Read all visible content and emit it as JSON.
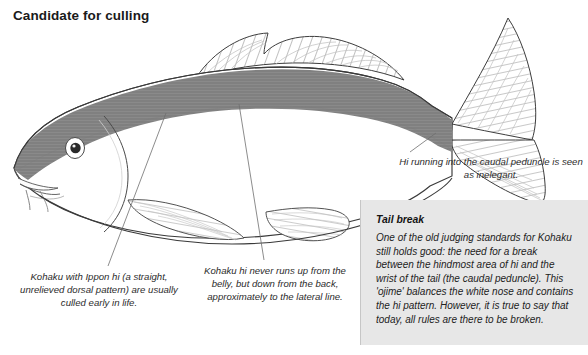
{
  "page": {
    "title": "Candidate for culling",
    "background_color": "#ffffff"
  },
  "illustration": {
    "name": "koi-kohaku-side-view",
    "hi_band_color": "#808080",
    "body_color": "#ffffff",
    "outline_color": "#3a3a3a",
    "fin_hatch_color": "#b4b4b4",
    "eye_color": "#1a1a1a",
    "leader_line_color": "#6e6e6e"
  },
  "captions": {
    "ippon": "Kohaku with Ippon hi (a straight, unrelieved dorsal pattern) are usually culled early in life.",
    "lateral_line": "Kohaku hi never runs up from the belly, but down from the back, approximately to the lateral line.",
    "caudal_peduncle": "Hi running into the caudal peduncle is seen as inelegant."
  },
  "tail_break_box": {
    "heading": "Tail break",
    "body": "One of the old judging standards for Kohaku still holds good: the need for a break between the hindmost area of hi and the wrist of the tail (the caudal peduncle). This 'ojime' balances the white nose and contains the hi pattern. However, it is true to say that today, all rules are there to be broken.",
    "background_color": "#e7e7e7"
  }
}
